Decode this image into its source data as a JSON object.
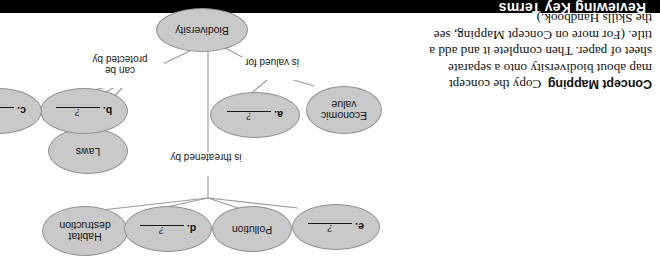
{
  "header": {
    "title": "Reviewing Key Terms"
  },
  "instruction": {
    "label": "Concept Mapping",
    "body": "Copy the concept map about biodiversity onto a separate sheet of paper. Then complete it and add a title. (For more on Concept Mapping, see the Skills Handbook.)"
  },
  "concept_map": {
    "nodes": [
      {
        "id": "biodiversity",
        "label": "Biodiversity",
        "type": "term"
      },
      {
        "id": "economic-value",
        "label": "Economic\nvalue",
        "type": "term"
      },
      {
        "id": "blank-a",
        "letter": "a.",
        "value": "?",
        "type": "blank"
      },
      {
        "id": "laws",
        "label": "Laws",
        "type": "term"
      },
      {
        "id": "blank-b",
        "letter": "b.",
        "value": "?",
        "type": "blank"
      },
      {
        "id": "blank-c",
        "letter": "c.",
        "value": "?",
        "type": "blank"
      },
      {
        "id": "habitat-destruction",
        "label": "Habitat\ndestruction",
        "type": "term"
      },
      {
        "id": "blank-d",
        "letter": "d.",
        "value": "?",
        "type": "blank"
      },
      {
        "id": "pollution",
        "label": "Pollution",
        "type": "term"
      },
      {
        "id": "blank-e",
        "letter": "e.",
        "value": "?",
        "type": "blank"
      }
    ],
    "edge_labels": [
      {
        "id": "valued-for",
        "text": "is valued for"
      },
      {
        "id": "protected-by",
        "text": "can be\nprotected by"
      },
      {
        "id": "threatened-by",
        "text": "is threatened by"
      }
    ],
    "colors": {
      "node_fill": "#c9c9c9",
      "node_stroke": "#8e8e8e",
      "edge_stroke": "#9a9a9a",
      "text": "#141414"
    }
  }
}
